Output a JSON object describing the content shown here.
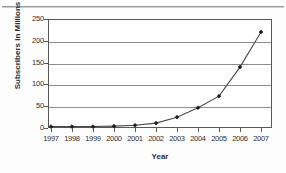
{
  "figure": {
    "background_color": "#fdfdfd",
    "frame_color": "#575757",
    "gridline_color": "#8d8d8d",
    "series_color": "#4a4a4a",
    "marker_color": "#1c1c1c"
  },
  "chart_data": {
    "type": "line",
    "title": "",
    "xlabel": "Year",
    "ylabel": "Subscribers in Millions",
    "categories": [
      "1997",
      "1998",
      "1999",
      "2000",
      "2001",
      "2002",
      "2003",
      "2004",
      "2005",
      "2006",
      "2007"
    ],
    "x": [
      1997,
      1998,
      1999,
      2000,
      2001,
      2002,
      2003,
      2004,
      2005,
      2006,
      2007
    ],
    "values": [
      1,
      1,
      1,
      2,
      4,
      9,
      23,
      45,
      72,
      140,
      222
    ],
    "series": [
      {
        "name": "Subscribers",
        "values": [
          1,
          1,
          1,
          2,
          4,
          9,
          23,
          45,
          72,
          140,
          222
        ]
      }
    ],
    "ylim": [
      0,
      250
    ],
    "yticks": [
      0,
      50,
      100,
      150,
      200,
      250
    ],
    "ytick_labels": [
      "0",
      "50",
      "100",
      "150",
      "200",
      "250"
    ],
    "xtick_labels": [
      "1997",
      "1998",
      "1999",
      "2000",
      "2001",
      "2002",
      "2003",
      "2004",
      "2005",
      "2006",
      "2007"
    ],
    "grid": "horizontal",
    "legend": "none",
    "marker": "diamond"
  }
}
